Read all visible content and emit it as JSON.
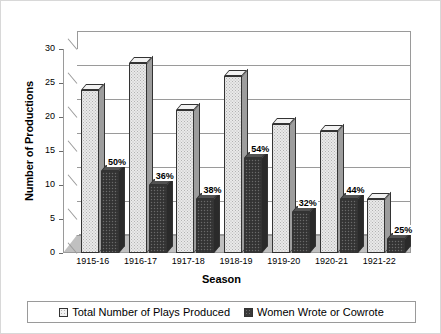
{
  "chart_data": {
    "type": "bar",
    "title": "Overall Participation Rate:  42%",
    "xlabel": "Season",
    "ylabel": "Number of Productions",
    "ylim": [
      0,
      30
    ],
    "yticks": [
      0,
      5,
      10,
      15,
      20,
      25,
      30
    ],
    "grid": true,
    "legend_position": "bottom",
    "categories": [
      "1915-16",
      "1916-17",
      "1917-18",
      "1918-19",
      "1919-20",
      "1920-21",
      "1921-22"
    ],
    "series": [
      {
        "name": "Total Number of Plays Produced",
        "color": "#e9e9e9",
        "values": [
          24,
          28,
          21,
          26,
          19,
          18,
          8
        ]
      },
      {
        "name": "Women Wrote or Cowrote",
        "color": "#3a3a3a",
        "values": [
          12,
          10,
          8,
          14,
          6,
          8,
          2
        ]
      }
    ],
    "annotations": [
      "50%",
      "36%",
      "38%",
      "54%",
      "32%",
      "44%",
      "25%"
    ]
  },
  "legend": {
    "items": [
      {
        "label": "Total Number of Plays Produced",
        "swatch": "light"
      },
      {
        "label": "Women Wrote or Cowrote",
        "swatch": "dark"
      }
    ]
  }
}
